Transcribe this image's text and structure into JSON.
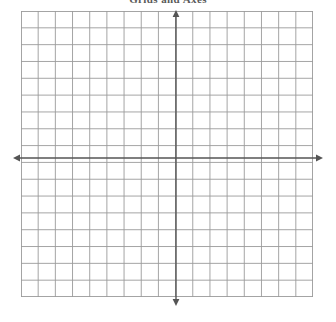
{
  "worksheet": {
    "title": "Grids and Axes",
    "background_color": "#ffffff"
  },
  "graph": {
    "name": "blank-coordinate-grid",
    "grid_line_color": "#9b9b9b",
    "axis_color": "#555555",
    "columns": 17,
    "rows": 17,
    "cell_width": 17.18,
    "cell_height": 16.82,
    "plot_left": 21,
    "plot_top": 11,
    "plot_width": 292,
    "plot_height": 286,
    "x_axis": {
      "label": "x-axis",
      "y_position": 158,
      "start_x": 13,
      "end_x": 323,
      "arrow_left": true,
      "arrow_right": true
    },
    "y_axis": {
      "label": "y-axis",
      "x_position": 176,
      "start_y": 10,
      "end_y": 306,
      "arrow_up": true,
      "arrow_down": true
    },
    "origin": {
      "x": 176,
      "y": 158
    },
    "tick_labels": [],
    "plotted_points": [],
    "plotted_curves": []
  },
  "chart_data": {
    "type": "scatter",
    "title": "Grids and Axes",
    "xlabel": "",
    "ylabel": "",
    "xlim": [
      -9,
      8
    ],
    "ylim": [
      -8,
      9
    ],
    "x": [],
    "values": [],
    "series": [],
    "grid": true,
    "legend": "none"
  }
}
